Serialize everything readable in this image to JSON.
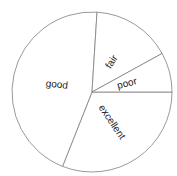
{
  "chart_data": {
    "type": "pie",
    "title": "",
    "categories": [
      "excellent",
      "good",
      "fair",
      "poor"
    ],
    "values": [
      31,
      45,
      16,
      8
    ],
    "unit": "%",
    "start_angle_deg": 0,
    "direction": "clockwise",
    "colors": [
      "#ffffff",
      "#ffffff",
      "#ffffff",
      "#ffffff"
    ],
    "edge_color": "#7f7f7f",
    "labels_rotated": true,
    "legend": null
  },
  "labels": {
    "excellent": "excellent",
    "good": "good",
    "fair": "fair",
    "poor": "poor"
  }
}
